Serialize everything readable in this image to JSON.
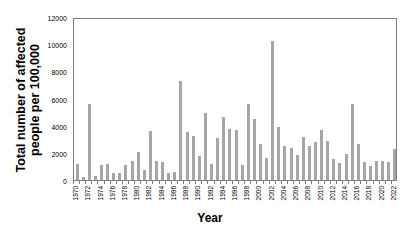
{
  "chart_data": {
    "type": "bar",
    "title": "",
    "xlabel": "Year",
    "ylabel": "Total number of affected people per 100,000",
    "ylabel_lines": [
      "Total number of affected",
      "people  per  100,000"
    ],
    "ylim": [
      0,
      12000
    ],
    "yticks": [
      0,
      2000,
      4000,
      6000,
      8000,
      10000,
      12000
    ],
    "xtick_labels": [
      "1970",
      "1972",
      "1974",
      "1976",
      "1978",
      "1980",
      "1982",
      "1984",
      "1986",
      "1988",
      "1990",
      "1992",
      "1994",
      "1996",
      "1998",
      "2000",
      "2002",
      "2004",
      "2006",
      "2008",
      "2010",
      "2012",
      "2014",
      "2016",
      "2018",
      "2020",
      "2022"
    ],
    "grid": false,
    "legend": null,
    "bar_color": "#a6a6a6",
    "categories": [
      "1970",
      "1971",
      "1972",
      "1973",
      "1974",
      "1975",
      "1976",
      "1977",
      "1978",
      "1979",
      "1980",
      "1981",
      "1982",
      "1983",
      "1984",
      "1985",
      "1986",
      "1987",
      "1988",
      "1989",
      "1990",
      "1991",
      "1992",
      "1993",
      "1994",
      "1995",
      "1996",
      "1997",
      "1998",
      "1999",
      "2000",
      "2001",
      "2002",
      "2003",
      "2004",
      "2005",
      "2006",
      "2007",
      "2008",
      "2009",
      "2010",
      "2011",
      "2012",
      "2013",
      "2014",
      "2015",
      "2016",
      "2017",
      "2018",
      "2019",
      "2020",
      "2021",
      "2022"
    ],
    "values": [
      1150,
      250,
      5600,
      300,
      1100,
      1200,
      500,
      500,
      1100,
      1400,
      2050,
      750,
      3600,
      1400,
      1300,
      500,
      600,
      7350,
      3550,
      3250,
      1750,
      5000,
      1200,
      3100,
      4650,
      3800,
      3700,
      1100,
      5650,
      4550,
      2700,
      1600,
      10300,
      3900,
      2500,
      2350,
      1850,
      3150,
      2500,
      2850,
      3700,
      2900,
      1550,
      1250,
      1900,
      5650,
      2700,
      1350,
      1050,
      1400,
      1400,
      1350,
      2300
    ]
  }
}
